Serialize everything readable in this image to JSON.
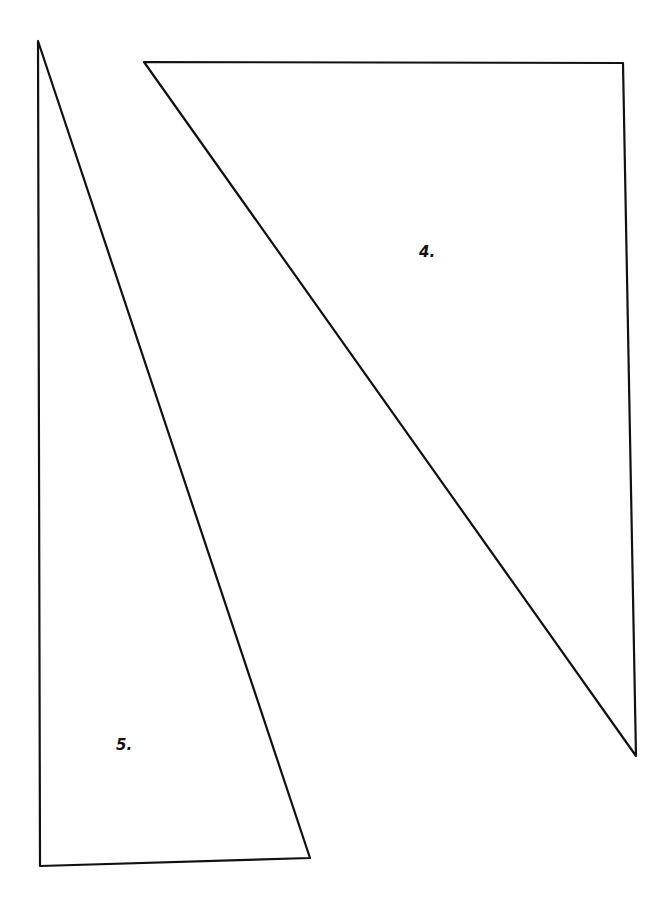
{
  "diagram": {
    "background": "#ffffff",
    "stroke_color": "#111111",
    "shapes": [
      {
        "id": "triangle-4",
        "label": "4.",
        "points": [
          [
            144,
            62
          ],
          [
            623,
            63
          ],
          [
            636,
            756
          ]
        ],
        "label_pos": [
          419,
          243
        ]
      },
      {
        "id": "triangle-5",
        "label": "5.",
        "points": [
          [
            38,
            41
          ],
          [
            40,
            866
          ],
          [
            310,
            858
          ]
        ],
        "label_pos": [
          116,
          736
        ]
      }
    ]
  }
}
